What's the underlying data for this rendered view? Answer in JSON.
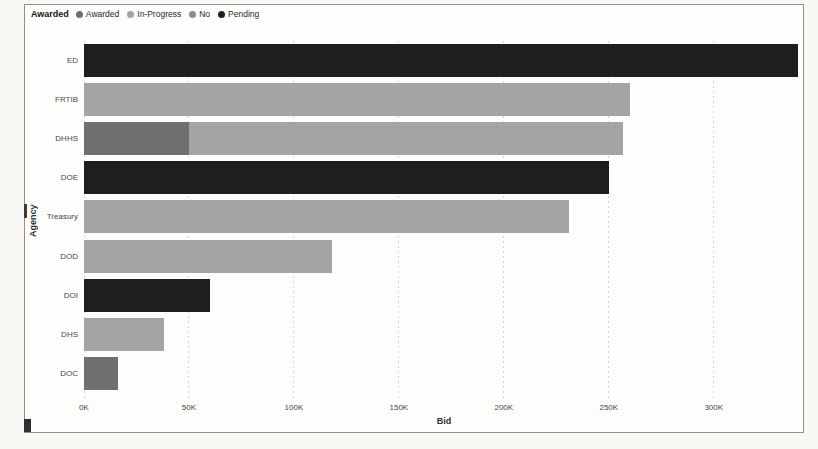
{
  "window": {
    "background": "#f8f7f4"
  },
  "panel": {
    "background": "#fdfdfc",
    "border_color": "#8f8f8f"
  },
  "chart_data": {
    "type": "bar",
    "orientation": "horizontal",
    "stacked": true,
    "xlabel": "Bid",
    "ylabel": "Agency",
    "grid": "vertical-dotted",
    "gridline_color": "#d6d6d6",
    "x_axis_max": 343000,
    "x_ticks": [
      {
        "label": "0K",
        "value": 0
      },
      {
        "label": "50K",
        "value": 50000
      },
      {
        "label": "100K",
        "value": 100000
      },
      {
        "label": "150K",
        "value": 150000
      },
      {
        "label": "200K",
        "value": 200000
      },
      {
        "label": "250K",
        "value": 250000
      },
      {
        "label": "300K",
        "value": 300000
      }
    ],
    "legend": {
      "title": "Awarded",
      "position": "top-left",
      "items": [
        {
          "label": "Awarded",
          "color": "#6f6f6f"
        },
        {
          "label": "In-Progress",
          "color": "#a4a4a4"
        },
        {
          "label": "No",
          "color": "#8c8c8c"
        },
        {
          "label": "Pending",
          "color": "#1e1e1e"
        }
      ]
    },
    "categories": [
      "ED",
      "FRTIB",
      "DHHS",
      "DOE",
      "Treasury",
      "DOD",
      "DOI",
      "DHS",
      "DOC"
    ],
    "bars": [
      {
        "agency": "ED",
        "segments": [
          {
            "status": "Pending",
            "value": 340000
          }
        ]
      },
      {
        "agency": "FRTIB",
        "segments": [
          {
            "status": "In-Progress",
            "value": 260000
          }
        ]
      },
      {
        "agency": "DHHS",
        "segments": [
          {
            "status": "Awarded",
            "value": 50000
          },
          {
            "status": "In-Progress",
            "value": 207000
          }
        ]
      },
      {
        "agency": "DOE",
        "segments": [
          {
            "status": "Pending",
            "value": 250000
          }
        ]
      },
      {
        "agency": "Treasury",
        "segments": [
          {
            "status": "In-Progress",
            "value": 231000
          }
        ]
      },
      {
        "agency": "DOD",
        "segments": [
          {
            "status": "In-Progress",
            "value": 118000
          }
        ]
      },
      {
        "agency": "DOI",
        "segments": [
          {
            "status": "Pending",
            "value": 60000
          }
        ]
      },
      {
        "agency": "DHS",
        "segments": [
          {
            "status": "In-Progress",
            "value": 38000
          }
        ]
      },
      {
        "agency": "DOC",
        "segments": [
          {
            "status": "Awarded",
            "value": 16000
          }
        ]
      }
    ]
  }
}
